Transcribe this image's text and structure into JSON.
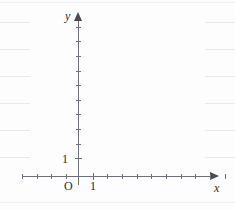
{
  "figure": {
    "kind": "blank-coordinate-axes",
    "background_color": "#fdfdfe",
    "axis_color": "#6e6e76",
    "label_color": "#2b2b30",
    "rule_color": "#e9e9ed"
  },
  "labels": {
    "x_axis": "x",
    "y_axis": "y",
    "origin": "O",
    "x_unit": "1",
    "y_unit": "1"
  },
  "chart_data": {
    "type": "scatter",
    "title": "",
    "subtitle": "",
    "xlabel": "x",
    "ylabel": "y",
    "origin_label": "O",
    "grid": false,
    "legend": null,
    "annotations": [],
    "series": [],
    "x": [],
    "values": [],
    "xlim": [
      -3.8,
      9.0
    ],
    "ylim": [
      -0.8,
      10.6
    ],
    "x_tick_labels": [
      "1"
    ],
    "y_tick_labels": [
      "1"
    ],
    "x_tick_values": [
      -3,
      -2,
      -1,
      0,
      1,
      2,
      3,
      4,
      5,
      6,
      7,
      8
    ],
    "y_tick_values": [
      1,
      2,
      3,
      4,
      5,
      6,
      7,
      8,
      9,
      10
    ],
    "unit_length_px": 14.7
  },
  "geometry": {
    "origin_px": {
      "x": 78,
      "y": 176
    },
    "tick_spacing_px": 14.7,
    "x_tick_offsets_px": [
      -56,
      -41,
      -27,
      -12,
      15,
      29,
      44,
      59,
      73,
      88,
      103,
      117,
      132,
      147,
      161,
      176,
      190
    ],
    "y_tick_offsets_px": [
      -18,
      -32,
      -47,
      -62,
      -76,
      -91,
      -105,
      -120,
      -135,
      -149
    ],
    "ruled_line_ys_px": [
      2,
      22,
      49,
      76,
      103,
      130,
      157,
      202
    ],
    "ruled_line_width_px": 30
  }
}
